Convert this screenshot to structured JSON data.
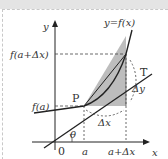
{
  "diagram": {
    "labels": {
      "y_axis": "y",
      "x_axis": "x",
      "origin": "0",
      "curve": "y=f(x)",
      "tangent": "T",
      "point": "P",
      "f_a_dx": "f(a+Δx)",
      "f_a": "f(a)",
      "a": "a",
      "a_dx": "a+Δx",
      "dx": "Δx",
      "dy": "Δy",
      "theta": "θ"
    },
    "colors": {
      "top_bar": "#e4e4e4",
      "line": "#222222",
      "shade": "#bdbdbd",
      "dashed": "#444444"
    }
  }
}
